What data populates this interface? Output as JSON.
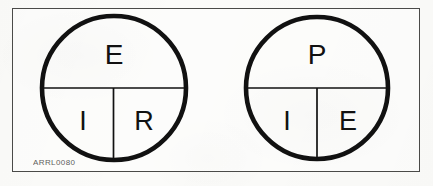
{
  "figure": {
    "caption_id": "ARRL0080",
    "border_color": "#4a4a48",
    "ink_color": "#111111",
    "background_color": "#fbfbf9",
    "circles": [
      {
        "name": "ohms-law-circle",
        "top_label": "E",
        "bottom_left_label": "I",
        "bottom_right_label": "R",
        "center_x": 114,
        "center_y": 88,
        "radius": 72
      },
      {
        "name": "power-law-circle",
        "top_label": "P",
        "bottom_left_label": "I",
        "bottom_right_label": "E",
        "center_x": 317,
        "center_y": 88,
        "radius": 71
      }
    ]
  }
}
